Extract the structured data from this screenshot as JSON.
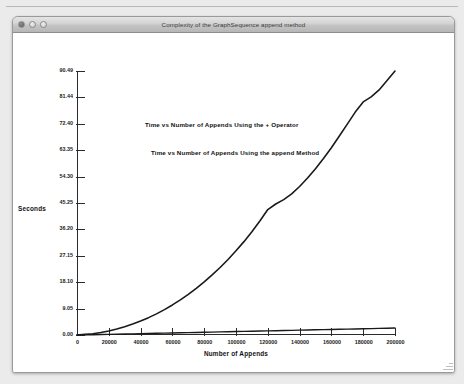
{
  "window": {
    "title": "Complexity of the GraphSequence append method",
    "controls": [
      {
        "name": "close",
        "label": ""
      },
      {
        "name": "minimize",
        "label": ""
      },
      {
        "name": "zoom",
        "label": ""
      }
    ]
  },
  "chart_data": {
    "type": "line",
    "title": "",
    "xlabel": "Number of Appends",
    "ylabel": "Seconds",
    "xlim": [
      0,
      200000
    ],
    "ylim": [
      0,
      90.49
    ],
    "grid": false,
    "legend_position": "inside-top-center",
    "annotations": [
      "Time vs Number of Appends Using the + Operator",
      "Time vs Number of Appends Using the append Method"
    ],
    "xticks": [
      0,
      20000,
      40000,
      60000,
      80000,
      100000,
      120000,
      140000,
      160000,
      180000,
      200000
    ],
    "xtick_labels": [
      "0",
      "20000",
      "40000",
      "60000",
      "80000",
      "100000",
      "120000",
      "140000",
      "160000",
      "180000",
      "200000"
    ],
    "yticks": [
      0.0,
      9.05,
      18.1,
      27.15,
      36.2,
      45.25,
      54.3,
      63.35,
      72.4,
      81.44,
      90.49
    ],
    "ytick_labels": [
      "0.00",
      "9.05",
      "18.10",
      "27.15",
      "36.20",
      "45.25",
      "54.30",
      "63.35",
      "72.40",
      "81.44",
      "90.49"
    ],
    "x": [
      0,
      5000,
      10000,
      15000,
      20000,
      25000,
      30000,
      35000,
      40000,
      45000,
      50000,
      55000,
      60000,
      65000,
      70000,
      75000,
      80000,
      85000,
      90000,
      95000,
      100000,
      105000,
      110000,
      115000,
      120000,
      125000,
      130000,
      135000,
      140000,
      145000,
      150000,
      155000,
      160000,
      165000,
      170000,
      175000,
      180000,
      185000,
      190000,
      195000,
      200000
    ],
    "series": [
      {
        "name": "Time vs Number of Appends Using the + Operator",
        "color": "#1a1a1a",
        "values": [
          0.0,
          0.2,
          0.45,
          0.85,
          1.4,
          2.05,
          2.85,
          3.75,
          4.8,
          5.95,
          7.25,
          8.7,
          10.3,
          12.05,
          13.95,
          16.0,
          18.2,
          20.6,
          23.15,
          25.9,
          28.85,
          32.0,
          35.4,
          39.1,
          43.0,
          44.9,
          46.4,
          48.4,
          50.9,
          53.8,
          57.0,
          60.5,
          64.2,
          68.2,
          72.3,
          76.4,
          79.9,
          81.6,
          84.0,
          87.2,
          90.49
        ]
      },
      {
        "name": "Time vs Number of Appends Using the append Method",
        "color": "#1a1a1a",
        "values": [
          0.0,
          0.05,
          0.1,
          0.16,
          0.22,
          0.28,
          0.34,
          0.4,
          0.46,
          0.52,
          0.58,
          0.64,
          0.7,
          0.76,
          0.82,
          0.88,
          0.94,
          1.0,
          1.06,
          1.12,
          1.18,
          1.24,
          1.3,
          1.36,
          1.42,
          1.48,
          1.54,
          1.6,
          1.66,
          1.72,
          1.78,
          1.84,
          1.9,
          1.96,
          2.02,
          2.08,
          2.14,
          2.2,
          2.26,
          2.32,
          2.38
        ]
      }
    ]
  }
}
